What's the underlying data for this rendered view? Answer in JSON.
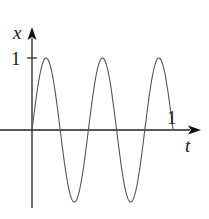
{
  "chart_data": {
    "type": "line",
    "title": "",
    "xlabel": "t",
    "ylabel": "x",
    "x_tick_labels": [
      "1"
    ],
    "y_tick_labels": [
      "1"
    ],
    "xlim": [
      0,
      1.1
    ],
    "ylim": [
      -1,
      1.1
    ],
    "grid": false,
    "legend": null,
    "series": [
      {
        "name": "x(t) = sin(5πt)",
        "function": "sin(5*pi*t)",
        "x": [
          0,
          0.1,
          0.2,
          0.3,
          0.4,
          0.5,
          0.6,
          0.7,
          0.8,
          0.9,
          1.0
        ],
        "values": [
          0,
          1,
          0,
          -1,
          0,
          1,
          0,
          -1,
          0,
          1,
          0
        ]
      }
    ]
  },
  "labels": {
    "x_axis": "t",
    "y_axis": "x",
    "x_tick": "1",
    "y_tick": "1"
  },
  "colors": {
    "axis": "#222222",
    "curve": "#555555"
  }
}
